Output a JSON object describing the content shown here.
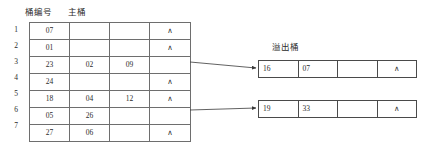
{
  "labels": {
    "bucket_number": "桶编号",
    "main_bucket": "主桶",
    "overflow_bucket": "溢出桶"
  },
  "colors": {
    "background": "#ffffff",
    "main_table_border": "#6e6e6e",
    "overflow_table_border": "#4a4a4a",
    "text": "#2b2b2b",
    "connector": "#3a3a3a"
  },
  "null_symbol": "∧",
  "main_table": {
    "row_numbers": [
      "1",
      "2",
      "3",
      "4",
      "5",
      "6",
      "7"
    ],
    "rows": [
      {
        "no": "1",
        "cells": [
          "07",
          "",
          "",
          "∧"
        ],
        "has_overflow": false
      },
      {
        "no": "2",
        "cells": [
          "01",
          "",
          "",
          "∧"
        ],
        "has_overflow": false
      },
      {
        "no": "3",
        "cells": [
          "23",
          "02",
          "09",
          ""
        ],
        "has_overflow": true
      },
      {
        "no": "4",
        "cells": [
          "24",
          "",
          "",
          "∧"
        ],
        "has_overflow": false
      },
      {
        "no": "5",
        "cells": [
          "18",
          "04",
          "12",
          "∧"
        ],
        "has_overflow": false
      },
      {
        "no": "6",
        "cells": [
          "05",
          "26",
          "",
          ""
        ],
        "has_overflow": true
      },
      {
        "no": "7",
        "cells": [
          "27",
          "06",
          "",
          "∧"
        ],
        "has_overflow": false
      }
    ]
  },
  "overflow_tables": [
    {
      "id": "overflow-1",
      "cells": [
        "16",
        "07",
        "",
        "∧"
      ],
      "source_row": "3"
    },
    {
      "id": "overflow-2",
      "cells": [
        "19",
        "33",
        "",
        "∧"
      ],
      "source_row": "6"
    }
  ]
}
